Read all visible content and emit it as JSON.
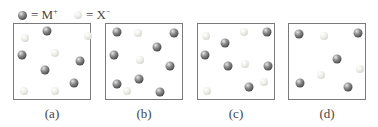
{
  "legend": {
    "cation": {
      "symbol": "M",
      "charge": "+",
      "equals": "=",
      "icon": "dark-sphere-icon",
      "color": "#4a4a4a"
    },
    "anion": {
      "symbol": "X",
      "charge": "−",
      "equals": "=",
      "icon": "light-sphere-icon",
      "color": "#d3d6cf"
    }
  },
  "panels": [
    {
      "label": "(a)",
      "left": 13,
      "spheres": [
        {
          "type": "dark",
          "x": 46,
          "y": 30
        },
        {
          "type": "light",
          "x": 24,
          "y": 37
        },
        {
          "type": "light",
          "x": 87,
          "y": 35
        },
        {
          "type": "dark",
          "x": 21,
          "y": 54
        },
        {
          "type": "light",
          "x": 54,
          "y": 52
        },
        {
          "type": "dark",
          "x": 79,
          "y": 60
        },
        {
          "type": "dark",
          "x": 44,
          "y": 69
        },
        {
          "type": "dark",
          "x": 73,
          "y": 82
        },
        {
          "type": "light",
          "x": 23,
          "y": 90
        },
        {
          "type": "light",
          "x": 54,
          "y": 90
        }
      ]
    },
    {
      "label": "(b)",
      "left": 105,
      "spheres": [
        {
          "type": "dark",
          "x": 116,
          "y": 31
        },
        {
          "type": "light",
          "x": 137,
          "y": 32
        },
        {
          "type": "dark",
          "x": 173,
          "y": 32
        },
        {
          "type": "dark",
          "x": 156,
          "y": 46
        },
        {
          "type": "dark",
          "x": 113,
          "y": 54
        },
        {
          "type": "light",
          "x": 139,
          "y": 59
        },
        {
          "type": "dark",
          "x": 169,
          "y": 65
        },
        {
          "type": "dark",
          "x": 138,
          "y": 78
        },
        {
          "type": "dark",
          "x": 116,
          "y": 83
        },
        {
          "type": "light",
          "x": 126,
          "y": 90
        },
        {
          "type": "dark",
          "x": 159,
          "y": 91
        }
      ]
    },
    {
      "label": "(c)",
      "left": 197,
      "spheres": [
        {
          "type": "light",
          "x": 205,
          "y": 35
        },
        {
          "type": "light",
          "x": 243,
          "y": 31
        },
        {
          "type": "dark",
          "x": 266,
          "y": 31
        },
        {
          "type": "dark",
          "x": 224,
          "y": 42
        },
        {
          "type": "dark",
          "x": 204,
          "y": 54
        },
        {
          "type": "dark",
          "x": 227,
          "y": 65
        },
        {
          "type": "light",
          "x": 244,
          "y": 63
        },
        {
          "type": "dark",
          "x": 267,
          "y": 65
        },
        {
          "type": "light",
          "x": 263,
          "y": 81
        },
        {
          "type": "dark",
          "x": 248,
          "y": 86
        },
        {
          "type": "light",
          "x": 206,
          "y": 90
        }
      ]
    },
    {
      "label": "(d)",
      "left": 288,
      "spheres": [
        {
          "type": "dark",
          "x": 298,
          "y": 33
        },
        {
          "type": "light",
          "x": 323,
          "y": 35
        },
        {
          "type": "dark",
          "x": 357,
          "y": 32
        },
        {
          "type": "dark",
          "x": 336,
          "y": 58
        },
        {
          "type": "light",
          "x": 359,
          "y": 68
        },
        {
          "type": "light",
          "x": 320,
          "y": 74
        },
        {
          "type": "dark",
          "x": 299,
          "y": 82
        },
        {
          "type": "dark",
          "x": 347,
          "y": 86
        }
      ]
    }
  ]
}
